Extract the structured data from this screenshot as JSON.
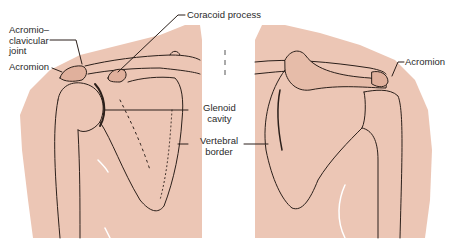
{
  "figure": {
    "type": "anatomical-diagram",
    "colors": {
      "skin": "#ecc6b5",
      "skin_light": "#f3d6c8",
      "line": "#2b1f1a",
      "background": "#ffffff"
    }
  },
  "labels": {
    "acromioclavicular_joint": [
      "Acromio–",
      "clavicular",
      "joint"
    ],
    "acromion_left": "Acromion",
    "coracoid_process": "Coracoid process",
    "glenoid_cavity": [
      "Glenoid",
      "cavity"
    ],
    "vertebral_border": [
      "Vertebral",
      "border"
    ],
    "acromion_right": "Acromion"
  },
  "views": [
    {
      "name": "left-shoulder-view",
      "side": "left"
    },
    {
      "name": "right-shoulder-view",
      "side": "right"
    }
  ]
}
